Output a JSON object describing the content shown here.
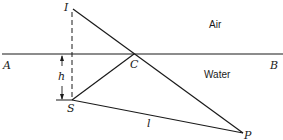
{
  "diagram": {
    "media": {
      "upper": "Air",
      "lower": "Water"
    },
    "points": {
      "A": "A",
      "B": "B",
      "C": "C",
      "I": "I",
      "S": "S",
      "P": "P"
    },
    "measures": {
      "depth": "h",
      "distance": "l"
    },
    "colors": {
      "line": "#1a1a1a",
      "background": "#ffffff"
    }
  }
}
